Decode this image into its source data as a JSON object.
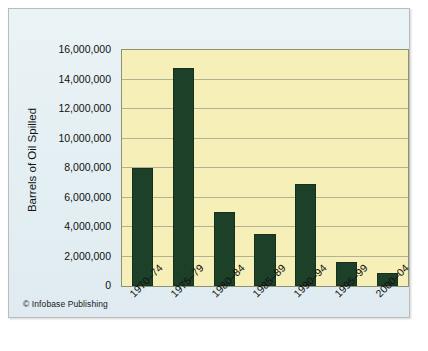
{
  "credit": "© Infobase Publishing",
  "chart_data": {
    "type": "bar",
    "title": "",
    "xlabel": "",
    "ylabel": "Barrels of Oil Spilled",
    "categories": [
      "1970–74",
      "1975–79",
      "1980–84",
      "1985–89",
      "1990–94",
      "1995–99",
      "2000–04"
    ],
    "values": [
      8000000,
      14750000,
      5000000,
      3550000,
      6950000,
      1600000,
      900000
    ],
    "ylim": [
      0,
      16000000
    ],
    "ytick_values": [
      0,
      2000000,
      4000000,
      6000000,
      8000000,
      10000000,
      12000000,
      14000000,
      16000000
    ],
    "ytick_labels": [
      "0",
      "2,000,000",
      "4,000,000",
      "6,000,000",
      "8,000,000",
      "10,000,000",
      "12,000,000",
      "14,000,000",
      "16,000,000"
    ],
    "grid": true,
    "legend": false,
    "legend_position": "none",
    "series": [
      {
        "name": "Barrels of Oil Spilled",
        "values": [
          8000000,
          14750000,
          5000000,
          3550000,
          6950000,
          1600000,
          900000
        ]
      }
    ],
    "colors": {
      "bar": "#1d4029",
      "plot_background": "#f6efb7",
      "card_background": "#e8f1f4",
      "gridline": "#9aa086",
      "axis": "#8d9277",
      "text": "#111111"
    }
  }
}
